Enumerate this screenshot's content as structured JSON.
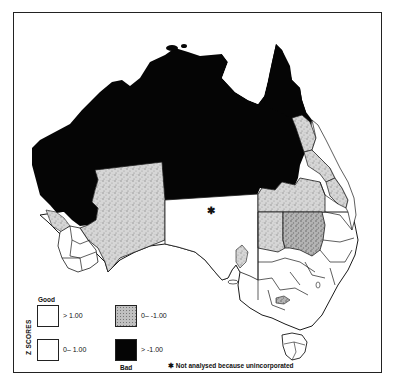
{
  "map": {
    "subject": "Australia regional Z scores",
    "unincorporated_marker": "✱",
    "colors": {
      "bad": "#050505",
      "stipple": "#c8c8c8",
      "stipple_dark": "#9a9a9a",
      "good": "#ffffff",
      "border": "#1a1a1a"
    }
  },
  "legend": {
    "title": "Z SCORES",
    "good_label": "Good",
    "bad_label": "Bad",
    "items": [
      {
        "label": "> 1.00",
        "fill": "white"
      },
      {
        "label": "0– 1.00",
        "fill": "white"
      },
      {
        "label": "0– -1.00",
        "fill": "stipple"
      },
      {
        "label": "> -1.00",
        "fill": "black"
      }
    ],
    "note_marker": "✱",
    "note": "Not analysed because unincorporated"
  }
}
